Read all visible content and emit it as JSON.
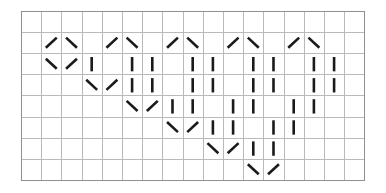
{
  "chart_data": {
    "type": "table",
    "title": "",
    "subtitle": "",
    "xlabel": "",
    "ylabel": "",
    "legend_position": "none",
    "grid": true,
    "columns": 17,
    "rows": 8,
    "cell_width": 20.2,
    "cell_height": 21.1,
    "symbol_names": {
      "slash": "right-leaning-diagonal",
      "backslash": "left-leaning-diagonal",
      "bar": "vertical-bar",
      "empty": "blank-cell"
    },
    "cells": [
      [
        "",
        "",
        "",
        "",
        "",
        "",
        "",
        "",
        "",
        "",
        "",
        "",
        "",
        "",
        "",
        "",
        ""
      ],
      [
        "",
        "/",
        "\\",
        "",
        "/",
        "\\",
        "",
        "/",
        "\\",
        "",
        "/",
        "\\",
        "",
        "/",
        "\\",
        "",
        ""
      ],
      [
        "",
        "\\",
        "/",
        "|",
        "",
        "|",
        "|",
        "",
        "|",
        "|",
        "",
        "|",
        "|",
        "",
        "|",
        "|",
        ""
      ],
      [
        "",
        "",
        "",
        "\\",
        "/",
        "|",
        "|",
        "",
        "|",
        "|",
        "",
        "|",
        "|",
        "",
        "|",
        "|",
        ""
      ],
      [
        "",
        "",
        "",
        "",
        "",
        "\\",
        "/",
        "|",
        "|",
        "",
        "|",
        "|",
        "",
        "|",
        "|",
        "",
        ""
      ],
      [
        "",
        "",
        "",
        "",
        "",
        "",
        "",
        "\\",
        "/",
        "|",
        "|",
        "",
        "|",
        "|",
        "",
        "",
        ""
      ],
      [
        "",
        "",
        "",
        "",
        "",
        "",
        "",
        "",
        "",
        "\\",
        "/",
        "|",
        "|",
        "",
        "",
        "",
        ""
      ],
      [
        "",
        "",
        "",
        "",
        "",
        "",
        "",
        "",
        "",
        "",
        "",
        "\\",
        "/",
        "",
        "",
        "",
        ""
      ]
    ],
    "colors": {
      "symbol": "#1a1a1a",
      "grid_line": "#b9b9bd",
      "grid_border": "#8e8e93",
      "background": "#ffffff"
    }
  }
}
